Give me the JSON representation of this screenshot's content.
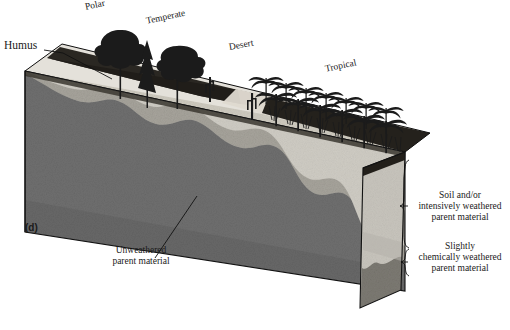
{
  "figure": {
    "panel_label": "(d)",
    "type": "geology-block-diagram"
  },
  "biome_labels": [
    {
      "id": "polar",
      "text": "Polar"
    },
    {
      "id": "temperate",
      "text": "Temperate"
    },
    {
      "id": "desert",
      "text": "Desert"
    },
    {
      "id": "tropical",
      "text": "Tropical"
    }
  ],
  "callouts": {
    "humus": "Humus",
    "unweathered": "Unweathered\nparent material"
  },
  "unweathered_line1": "Unweathered",
  "unweathered_line2": "parent material",
  "brackets": [
    {
      "id": "soil-zone",
      "line1": "Soil and/or",
      "line2": "intensively weathered",
      "line3": "parent material"
    },
    {
      "id": "slightly-weathered-zone",
      "line1": "Slightly",
      "line2": "chemically weathered",
      "line3": "parent material"
    }
  ],
  "colors": {
    "background": "#ffffff",
    "humus": "#1d1d1d",
    "top_surface_light": "#d9d6cf",
    "top_surface_mid": "#b9b5ad",
    "intensely_weathered": "#cfccc4",
    "slightly_weathered": "#a6a49d",
    "unweathered": "#6f6f6f",
    "unweathered_dark": "#5a5a5a",
    "end_cap": "#c8c5bd",
    "outline": "#111111",
    "text": "#1a1a1a"
  }
}
